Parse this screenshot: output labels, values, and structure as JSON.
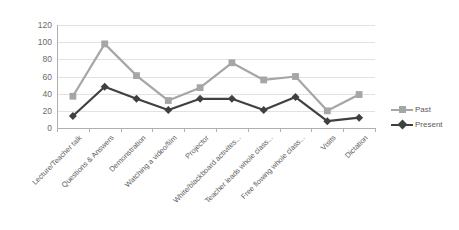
{
  "chart_data": {
    "type": "line",
    "title": "",
    "subtitle": "",
    "xlabel": "",
    "ylabel": "",
    "ylim": [
      0,
      120
    ],
    "ytick_step": 20,
    "yticks": [
      120,
      100,
      80,
      60,
      40,
      20,
      0
    ],
    "grid": true,
    "legend_position": "right",
    "categories": [
      "Lecture/Teacher talk",
      "Questions & Answers",
      "Demonstration",
      "Watching a video/film",
      "Projector",
      "White/blackboard activites...",
      "Teacher leads whole class...",
      "Free flowing whole class...",
      "Visits",
      "Dictation"
    ],
    "series": [
      {
        "name": "Past",
        "color": "#a6a6a6",
        "marker": "square",
        "values": [
          37,
          98,
          61,
          32,
          47,
          76,
          56,
          60,
          20,
          39
        ]
      },
      {
        "name": "Present",
        "color": "#404040",
        "marker": "diamond",
        "values": [
          14,
          48,
          34,
          21,
          34,
          34,
          21,
          36,
          8,
          12
        ]
      }
    ]
  },
  "legend": {
    "items": [
      {
        "label": "Past"
      },
      {
        "label": "Present"
      }
    ]
  },
  "colors": {
    "past": "#a6a6a6",
    "present": "#404040",
    "grid": "#e2e2e2",
    "axis": "#b0b0b0",
    "text": "#5d5d5d",
    "background": "#ffffff"
  }
}
